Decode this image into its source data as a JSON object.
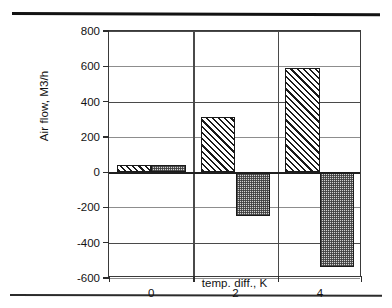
{
  "decorations": {
    "top_rule": "horizontal-rule",
    "bottom_rule": "horizontal-rule"
  },
  "chart_data": {
    "type": "bar",
    "title": "",
    "subtitle": "",
    "xlabel": "temp. diff., K",
    "ylabel": "Air flow, M3/h",
    "categories": [
      "0",
      "2",
      "4"
    ],
    "xtick_labels": [
      "0",
      "2",
      "4"
    ],
    "ytick_labels": [
      "800",
      "600",
      "400",
      "200",
      "0",
      "-200",
      "-400",
      "-600"
    ],
    "yticks": [
      800,
      600,
      400,
      200,
      0,
      -200,
      -400,
      -600
    ],
    "ylim": [
      -600,
      800
    ],
    "grid": "horizontal-and-category-separators",
    "legend": "none",
    "legend_position": "none",
    "series": [
      {
        "name": "supply",
        "pattern": "diagonal-hatch",
        "color": "#1a1a1a",
        "values": [
          40,
          315,
          590
        ]
      },
      {
        "name": "extract",
        "pattern": "gray-stipple",
        "color": "#d2d2d2",
        "values": [
          40,
          -250,
          -540
        ]
      }
    ],
    "annotations": []
  }
}
